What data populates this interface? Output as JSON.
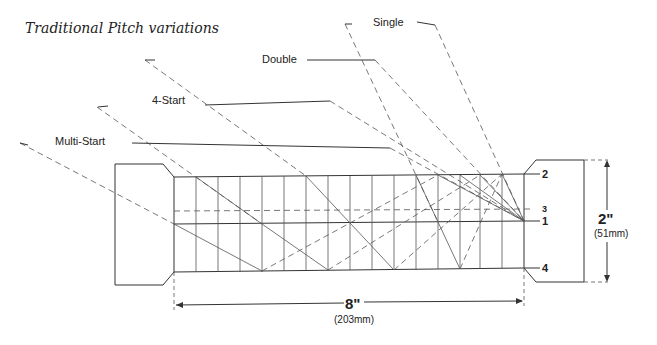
{
  "title": "Traditional Pitch variations",
  "labels": {
    "single": "Single",
    "double": "Double",
    "four_start": "4-Start",
    "multi_start": "Multi-Start"
  },
  "line_numbers": [
    "1",
    "2",
    "3",
    "4"
  ],
  "dimensions": {
    "length_in": "8\"",
    "length_mm": "(203mm)",
    "diameter_in": "2\"",
    "diameter_mm": "(51mm)"
  }
}
